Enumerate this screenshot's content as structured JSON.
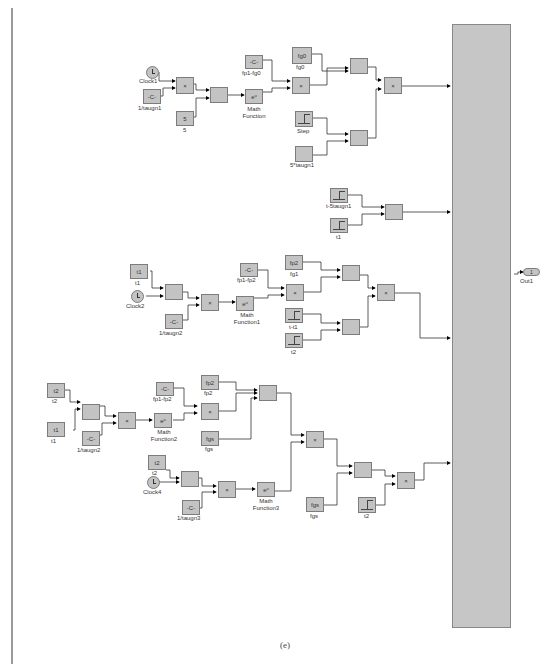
{
  "caption": "(e)",
  "output_port": {
    "number": "1",
    "label": "Out1"
  },
  "section1": {
    "clock": "Clock1",
    "const_taugn1": {
      "glyph": "-C-",
      "label": "1/taugn1"
    },
    "product1": "×",
    "const5": {
      "glyph": "5",
      "label": "5"
    },
    "sum1": "",
    "mathfn": {
      "glyph": "eᵘ",
      "label": "Math Function"
    },
    "const_fp1fg0": {
      "glyph": "-C-",
      "label": "fp1-fg0"
    },
    "const_fg0": {
      "glyph": "fg0",
      "label": "fg0"
    },
    "product2": "×",
    "sum2": "",
    "product3": "×",
    "step": {
      "label": "Step"
    },
    "const_5taugn1": {
      "glyph": "",
      "label": "5*taugn1"
    },
    "sum3": ""
  },
  "section2": {
    "step_a": {
      "label": "t-5taugn1"
    },
    "step_b": {
      "label": "t1"
    },
    "sum": ""
  },
  "section3": {
    "const_t1": {
      "glyph": "t1",
      "label": "t1"
    },
    "clock": "Clock2",
    "sum1": "",
    "const_taugn2": {
      "glyph": "-C-",
      "label": "1/taugn2"
    },
    "product1": "×",
    "mathfn": {
      "glyph": "eᵘ",
      "label": "Math Function1"
    },
    "const_fp1fp2": {
      "glyph": "-C-",
      "label": "fp1-fp2"
    },
    "const_fp2": {
      "glyph": "fp2",
      "label": "fg1"
    },
    "product2": "×",
    "sum2": "",
    "product3": "×",
    "step_t1": {
      "label": "t-t1"
    },
    "step_t2": {
      "label": "t2"
    },
    "sum3": ""
  },
  "section4": {
    "const_t2": {
      "glyph": "t2",
      "label": "t2"
    },
    "const_t1": {
      "glyph": "t1",
      "label": "t1"
    },
    "sum1": "",
    "const_taugn2": {
      "glyph": "-C-",
      "label": "1/taugn2"
    },
    "product1": "×",
    "mathfn2": {
      "glyph": "eᵘ",
      "label": "Math Function2"
    },
    "const_fp1fp2": {
      "glyph": "-C-",
      "label": "fp1-fp2"
    },
    "const_fp2": {
      "glyph": "fp2",
      "label": "fp2"
    },
    "product2": "×",
    "const_fgs": {
      "glyph": "fgs",
      "label": "fgs"
    },
    "sum3in": "",
    "const_t2b": {
      "glyph": "t2",
      "label": "t2"
    },
    "clock": "Clock4",
    "sum2": "",
    "const_taugn3": {
      "glyph": "-C-",
      "label": "1/taugn3"
    },
    "product3": "×",
    "mathfn3": {
      "glyph": "eᵘ",
      "label": "Math Function3"
    },
    "product4": "×",
    "const_fgs2": {
      "glyph": "fgs",
      "label": "fgs"
    },
    "sum4": "",
    "step_t2": {
      "label": "t2"
    },
    "product5": "×"
  }
}
